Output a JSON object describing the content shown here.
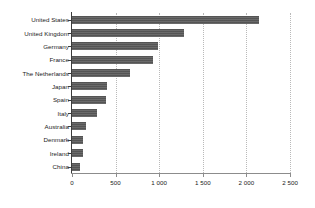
{
  "chart_data": {
    "type": "bar",
    "orientation": "horizontal",
    "title": "",
    "subtitle": "",
    "xlabel": "",
    "ylabel": "",
    "categories": [
      "United States",
      "United Kingdom",
      "Germany",
      "France",
      "The Netherlands",
      "Japan",
      "Spain",
      "Italy",
      "Australia",
      "Denmark",
      "Ireland",
      "China"
    ],
    "values": [
      2145,
      1285,
      985,
      930,
      665,
      400,
      390,
      285,
      160,
      125,
      125,
      90
    ],
    "xlim": [
      0,
      2500
    ],
    "xticks": [
      0,
      500,
      1000,
      1500,
      2000,
      2500
    ],
    "xtick_labels": [
      "0",
      "500",
      "1 000",
      "1 500",
      "2 000",
      "2 500"
    ],
    "grid": "vertical-dotted",
    "legend": "none",
    "bar_color": "#595959",
    "gridline_color": "#b9b9b9",
    "axis_color": "#3c3c3c",
    "text_color": "#1a1a1a"
  }
}
